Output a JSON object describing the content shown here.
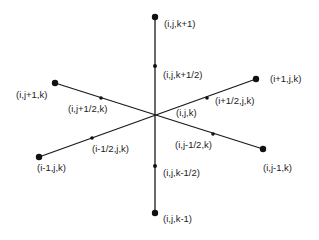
{
  "diagram": {
    "type": "3D finite-volume grid stencil",
    "center": {
      "label": "(i,j,k)"
    },
    "axes": [
      {
        "name": "k-axis",
        "direction": "vertical",
        "positive_node": "(i,j,k+1)",
        "positive_mid": "(i,j,k+1/2)",
        "negative_node": "(i,j,k-1)",
        "negative_mid": "(i,j,k-1/2)"
      },
      {
        "name": "i-axis",
        "direction": "diagonal-rising",
        "positive_node": "(i+1,j,k)",
        "positive_mid": "(i+1/2,j,k)",
        "negative_node": "(i-1,j,k)",
        "negative_mid": "(i-1/2,j,k)"
      },
      {
        "name": "j-axis",
        "direction": "diagonal-falling",
        "positive_node": "(i,j+1,k)",
        "positive_mid": "(i,j+1/2,k)",
        "negative_node": "(i,j-1,k)",
        "negative_mid": "(i,j-1/2,k)"
      }
    ],
    "labels": {
      "center": "(i,j,k)",
      "k_plus_1": "(i,j,k+1)",
      "k_plus_half": "(i,j,k+1/2)",
      "k_minus_half": "(i,j,k-1/2)",
      "k_minus_1": "(i,j,k-1)",
      "i_plus_1": "(i+1,j,k)",
      "i_plus_half": "(i+1/2,j,k)",
      "i_minus_half": "(i-1/2,j,k)",
      "i_minus_1": "(i-1,j,k)",
      "j_plus_1": "(i,j+1,k)",
      "j_plus_half": "(i,j+1/2,k)",
      "j_minus_half": "(i,j-1/2,k)",
      "j_minus_1": "(i,j-1,k)"
    },
    "colors": {
      "line": "#1a1a1a",
      "node": "#111111",
      "text": "#1c1c1c",
      "background": "#ffffff"
    }
  }
}
